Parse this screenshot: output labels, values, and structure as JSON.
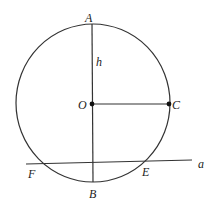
{
  "diagram": {
    "type": "geometry",
    "circle": {
      "center": "O",
      "label_center": "O"
    },
    "points": {
      "A": {
        "label": "A"
      },
      "B": {
        "label": "B"
      },
      "C": {
        "label": "C"
      },
      "O": {
        "label": "O"
      },
      "E": {
        "label": "E"
      },
      "F": {
        "label": "F"
      }
    },
    "segment_labels": {
      "AO": "h"
    },
    "line_label": "a",
    "colors": {
      "stroke": "#333333",
      "background": "#ffffff"
    }
  }
}
